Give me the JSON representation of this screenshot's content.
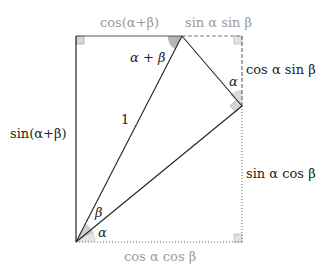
{
  "diagram": {
    "labels": {
      "top_left": "cos(α+β)",
      "top_right": "sin α sin β",
      "right_upper": "cos α sin β",
      "right_lower": "sin α cos β",
      "left": "sin(α+β)",
      "bottom": "cos α cos β",
      "hypotenuse": "1",
      "angle_apex": "α + β",
      "angle_right": "α",
      "angle_beta": "β",
      "angle_alpha": "α"
    },
    "colors": {
      "line": "#222222",
      "gray_text": "#9a9a9a",
      "angle_fill": "#cccccc",
      "apex_fill": "#b0b0b0",
      "square_fill": "#dddddd"
    }
  }
}
